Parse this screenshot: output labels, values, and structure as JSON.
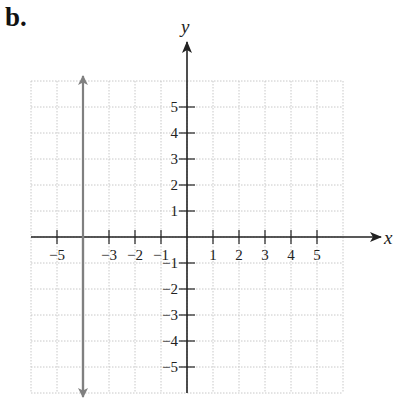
{
  "panel_label": "b.",
  "chart_data": {
    "type": "line",
    "title": "",
    "xlabel": "x",
    "ylabel": "y",
    "xlim": [
      -6,
      6
    ],
    "ylim": [
      -6,
      6
    ],
    "grid": true,
    "x_ticks": [
      -5,
      -4,
      -3,
      -2,
      -1,
      1,
      2,
      3,
      4,
      5
    ],
    "x_tick_labels": [
      "−5",
      "−3",
      "−2",
      "−1",
      "1",
      "2",
      "3",
      "4",
      "5"
    ],
    "x_tick_label_values": [
      -5,
      -3,
      -2,
      -1,
      1,
      2,
      3,
      4,
      5
    ],
    "y_ticks": [
      -5,
      -4,
      -3,
      -2,
      -1,
      1,
      2,
      3,
      4,
      5
    ],
    "y_tick_labels": [
      "5",
      "4",
      "3",
      "2",
      "1",
      "−1",
      "−2",
      "−3",
      "−4",
      "−5"
    ],
    "y_tick_label_values": [
      5,
      4,
      3,
      2,
      1,
      -1,
      -2,
      -3,
      -4,
      -5
    ],
    "series": [
      {
        "name": "vertical line x = -4",
        "equation": "x = -4",
        "x": [
          -4,
          -4
        ],
        "y": [
          -6,
          6
        ],
        "arrows": "both",
        "color": "#808080"
      }
    ],
    "axis_color": "#222222",
    "grid_color": "#c8c8c8"
  }
}
